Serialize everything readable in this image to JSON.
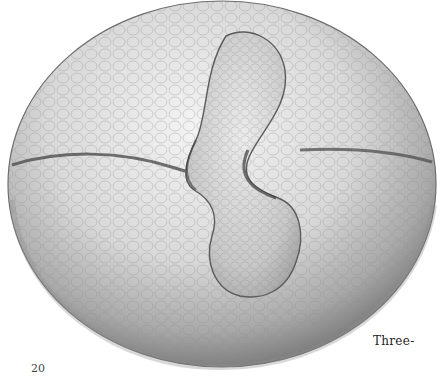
{
  "page": {
    "caption_fragment": "Three-",
    "page_number": "20"
  },
  "illustration": {
    "subject": "three-dimensional cell-textured sphere with interlocking segmented lobes (pencil drawing)"
  }
}
